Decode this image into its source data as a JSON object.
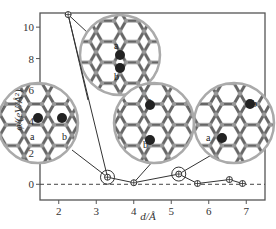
{
  "chart_data": {
    "type": "line",
    "title": "",
    "xlabel": "d/Å",
    "ylabel": "φ/(eV/Å²)",
    "xlim": [
      1.5,
      7.5
    ],
    "ylim": [
      -1.0,
      10.9
    ],
    "xticks": [
      2,
      3,
      4,
      5,
      6,
      7
    ],
    "yticks": [
      0,
      2,
      4,
      6,
      8,
      10
    ],
    "grid": false,
    "reference_line": {
      "y": 0,
      "style": "dashed"
    },
    "series": [
      {
        "name": "phi",
        "marker": "circle-plus",
        "x": [
          2.25,
          3.3,
          4.0,
          5.2,
          5.7,
          6.55,
          6.9
        ],
        "y": [
          10.8,
          0.45,
          0.1,
          0.65,
          0.05,
          0.3,
          0.05
        ]
      }
    ],
    "highlighted_points": [
      {
        "x": 3.3,
        "y": 0.45,
        "circled": true
      },
      {
        "x": 5.2,
        "y": 0.65,
        "circled": true
      }
    ],
    "insets": [
      {
        "name": "structure-inset-top",
        "points_to_x": 2.25,
        "labels": [
          "a",
          "b"
        ]
      },
      {
        "name": "structure-inset-left",
        "points_to_x": 3.3,
        "labels": [
          "a",
          "b"
        ]
      },
      {
        "name": "structure-inset-middle",
        "points_to_x": 4.0,
        "labels": [
          "a",
          "b"
        ]
      },
      {
        "name": "structure-inset-right",
        "points_to_x": 5.2,
        "labels": [
          "a",
          "b"
        ]
      }
    ]
  }
}
